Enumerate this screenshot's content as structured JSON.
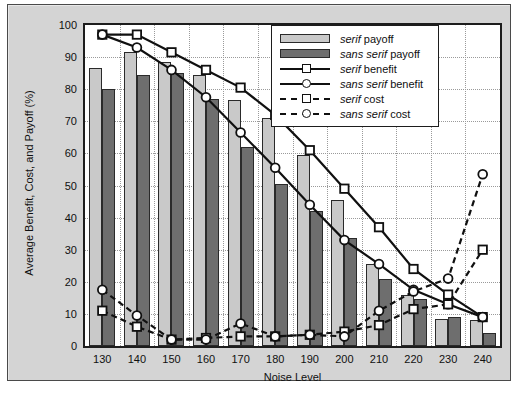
{
  "chart_data": {
    "type": "bar",
    "title": "",
    "xlabel": "Noise Level",
    "ylabel": "Average Benefit, Cost, and Payoff (%)",
    "categories": [
      130,
      140,
      150,
      160,
      170,
      180,
      190,
      200,
      210,
      220,
      230,
      240
    ],
    "xtick_labels": [
      "130",
      "140",
      "150",
      "160",
      "170",
      "180",
      "190",
      "200",
      "210",
      "220",
      "230",
      "240"
    ],
    "ytick_labels": [
      "0",
      "10",
      "20",
      "30",
      "40",
      "50",
      "60",
      "70",
      "80",
      "90",
      "100"
    ],
    "yticks": [
      0,
      10,
      20,
      30,
      40,
      50,
      60,
      70,
      80,
      90,
      100
    ],
    "ylim": [
      0,
      100
    ],
    "grid": true,
    "legend_position": "upper right",
    "series": [
      {
        "name": "serif payoff",
        "kind": "bar",
        "color": "#c9c9c9",
        "values": [
          86.5,
          91.5,
          88.5,
          84.5,
          76.5,
          71,
          59.5,
          45.5,
          25.5,
          16,
          8.5,
          8
        ]
      },
      {
        "name": "sans serif payoff",
        "kind": "bar",
        "color": "#6e6e6e",
        "values": [
          80,
          84.5,
          85,
          77,
          62,
          50.5,
          42,
          33.5,
          21,
          14.5,
          9,
          4
        ]
      },
      {
        "name": "serif benefit",
        "kind": "line",
        "marker": "square",
        "line_style": "solid",
        "color": "#101010",
        "values": [
          97,
          97,
          91.5,
          86,
          80.5,
          72,
          61,
          49,
          37,
          24,
          16,
          9
        ]
      },
      {
        "name": "sans serif benefit",
        "kind": "line",
        "marker": "circle",
        "line_style": "solid",
        "color": "#101010",
        "values": [
          97,
          93,
          86,
          77.5,
          66.5,
          55.5,
          44,
          33,
          25.5,
          17.5,
          13,
          9
        ]
      },
      {
        "name": "serif cost",
        "kind": "line",
        "marker": "square",
        "line_style": "dashed",
        "color": "#101010",
        "values": [
          11,
          6,
          2,
          2.5,
          3,
          3,
          3.5,
          4.5,
          6.5,
          11.5,
          13,
          30
        ]
      },
      {
        "name": "sans serif cost",
        "kind": "line",
        "marker": "circle",
        "line_style": "dashed",
        "color": "#101010",
        "values": [
          17.5,
          9.5,
          2,
          2,
          7,
          3,
          3.5,
          3,
          11,
          17,
          21,
          53.5
        ]
      }
    ]
  },
  "legend": {
    "items": [
      {
        "label_em": "serif",
        "label_rest": " payoff",
        "key": "swatch-light"
      },
      {
        "label_em": "sans serif",
        "label_rest": " payoff",
        "key": "swatch-dark"
      },
      {
        "label_em": "serif",
        "label_rest": " benefit",
        "key": "line-solid-square"
      },
      {
        "label_em": "sans serif",
        "label_rest": " benefit",
        "key": "line-solid-circle"
      },
      {
        "label_em": "serif",
        "label_rest": " cost",
        "key": "line-dashed-square"
      },
      {
        "label_em": "sans serif",
        "label_rest": " cost",
        "key": "line-dashed-circle"
      }
    ]
  }
}
